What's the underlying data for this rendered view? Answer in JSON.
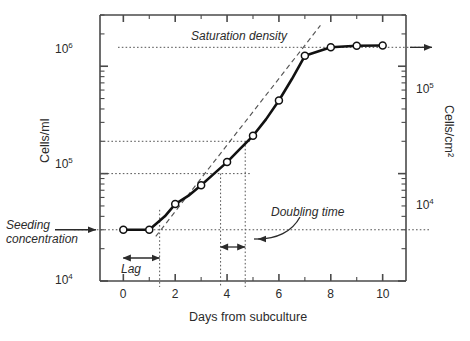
{
  "chart_data": {
    "type": "line",
    "title": "",
    "xlabel": "Days from subculture",
    "ylabel": "Cells/ml",
    "y2label": "Cells/cm²",
    "xlim": [
      -0.9,
      10.9
    ],
    "ylim": [
      10000,
      3000000
    ],
    "y2lim": [
      1000,
      300000
    ],
    "xscale": "linear",
    "yscale": "log",
    "grid": false,
    "legend": null,
    "xticks": [
      0,
      2,
      4,
      6,
      8,
      10
    ],
    "xtick_labels": [
      "0",
      "2",
      "4",
      "6",
      "8",
      "10"
    ],
    "xminorticks": [
      1,
      3,
      5,
      7,
      9
    ],
    "yticks": [
      10000,
      100000,
      1000000
    ],
    "ytick_labels": [
      "10⁴",
      "10⁵",
      "10⁶"
    ],
    "ytick_mantissas": [
      "10",
      "10",
      "10"
    ],
    "ytick_exponents": [
      "4",
      "5",
      "6"
    ],
    "y2ticks": [
      10000,
      100000
    ],
    "y2tick_labels": [
      "10⁴",
      "10⁵"
    ],
    "series": [
      {
        "name": "growth curve",
        "marker": "open-circle",
        "x": [
          0.0,
          1.0,
          1.6,
          2.0,
          2.5,
          3.0,
          3.5,
          4.0,
          4.5,
          5.0,
          5.5,
          6.0,
          6.5,
          7.0,
          8.0,
          9.0,
          10.0
        ],
        "y": [
          30000,
          30000,
          40000,
          52000,
          62000,
          78000,
          100000,
          128000,
          170000,
          225000,
          320000,
          480000,
          760000,
          1250000,
          1500000,
          1550000,
          1560000
        ]
      }
    ],
    "tangent_line": {
      "name": "exponential-phase tangent",
      "style": "dashed",
      "x": [
        1.25,
        7.6
      ],
      "y": [
        26000,
        2400000
      ]
    },
    "reference_lines": [
      {
        "name": "saturation-density",
        "orientation": "horizontal",
        "y": 1500000,
        "style": "dotted"
      },
      {
        "name": "doubling-upper",
        "orientation": "horizontal",
        "y": 200000,
        "style": "dotted"
      },
      {
        "name": "doubling-lower",
        "orientation": "horizontal",
        "y": 100000,
        "style": "dotted"
      },
      {
        "name": "seeding-concentration",
        "orientation": "horizontal",
        "y": 30000,
        "style": "dotted"
      },
      {
        "name": "lag-end",
        "orientation": "vertical",
        "x": 1.4,
        "style": "dotted"
      },
      {
        "name": "doubling-start",
        "orientation": "vertical",
        "x": 3.75,
        "style": "dotted"
      },
      {
        "name": "doubling-end",
        "orientation": "vertical",
        "x": 4.7,
        "style": "dotted"
      }
    ],
    "annotations": [
      {
        "name": "saturation-density",
        "text": "Saturation density",
        "style": "italic"
      },
      {
        "name": "seeding-concentration",
        "text": "Seeding\nconcentration",
        "line1": "Seeding",
        "line2": "concentration",
        "style": "italic"
      },
      {
        "name": "lag",
        "text": "Lag",
        "style": "italic",
        "span_x": [
          0.0,
          1.4
        ]
      },
      {
        "name": "doubling-time",
        "text": "Doubling time",
        "style": "italic",
        "span_x": [
          3.75,
          4.7
        ]
      }
    ],
    "colors": {
      "curve": "#111111",
      "marker_fill": "#ffffff",
      "marker_edge": "#111111",
      "axis": "#4a4a4a",
      "dotted": "#555555",
      "tangent": "#555555",
      "text": "#2b2b2b"
    }
  },
  "axes": {
    "x_title": "Days from subculture",
    "y_left_title": "Cells/ml",
    "y_right_title": "Cells/cm²"
  },
  "ticks": {
    "x": [
      "0",
      "2",
      "4",
      "6",
      "8",
      "10"
    ],
    "y_left": [
      {
        "mantissa": "10",
        "exponent": "6"
      },
      {
        "mantissa": "10",
        "exponent": "5"
      },
      {
        "mantissa": "10",
        "exponent": "4"
      }
    ],
    "y_right": [
      {
        "mantissa": "10",
        "exponent": "5"
      },
      {
        "mantissa": "10",
        "exponent": "4"
      }
    ]
  },
  "annotations": {
    "saturation_density": "Saturation density",
    "seeding_line1": "Seeding",
    "seeding_line2": "concentration",
    "lag": "Lag",
    "doubling_time": "Doubling time"
  }
}
